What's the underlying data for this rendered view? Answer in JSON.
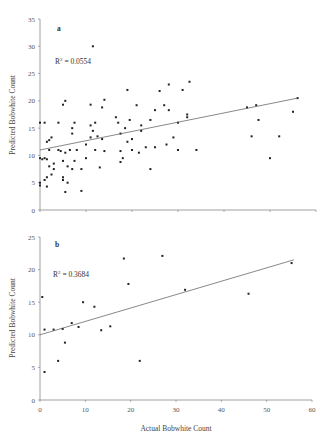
{
  "chart_data": [
    {
      "type": "scatter",
      "panel": "a",
      "title": "",
      "xlabel": "",
      "ylabel": "Predicted Bobwhite Count",
      "xlim": [
        0,
        60
      ],
      "ylim": [
        0,
        35
      ],
      "yticks": [
        0,
        5,
        10,
        15,
        20,
        25,
        30,
        35
      ],
      "xticks": [
        0,
        10,
        20,
        30,
        40,
        50,
        60
      ],
      "x_tick_labels_shown": false,
      "grid": false,
      "annotation": "R² = 0.0554",
      "trendline": {
        "x": [
          0,
          56
        ],
        "y": [
          11.0,
          20.5
        ]
      },
      "points": [
        [
          0,
          16
        ],
        [
          0,
          9.5
        ],
        [
          0,
          5
        ],
        [
          0,
          4.5
        ],
        [
          0.5,
          9.3
        ],
        [
          1,
          16
        ],
        [
          1,
          5.5
        ],
        [
          1,
          9.5
        ],
        [
          1.5,
          9.3
        ],
        [
          1.5,
          4.3
        ],
        [
          1.5,
          6
        ],
        [
          1.5,
          12.5
        ],
        [
          2,
          12.8
        ],
        [
          2,
          11
        ],
        [
          2,
          8
        ],
        [
          2.5,
          6.5
        ],
        [
          2.5,
          13.3
        ],
        [
          3,
          8.5
        ],
        [
          3,
          7.5
        ],
        [
          4,
          16
        ],
        [
          4,
          11
        ],
        [
          4.5,
          10.8
        ],
        [
          5,
          19.3
        ],
        [
          5,
          5.5
        ],
        [
          5,
          6
        ],
        [
          5,
          9
        ],
        [
          5.5,
          20
        ],
        [
          5.5,
          10.5
        ],
        [
          5.5,
          3.3
        ],
        [
          6,
          5
        ],
        [
          6,
          8
        ],
        [
          6.5,
          11
        ],
        [
          7,
          14
        ],
        [
          7,
          15
        ],
        [
          7,
          7.5
        ],
        [
          7.5,
          16
        ],
        [
          7.5,
          9
        ],
        [
          8,
          11
        ],
        [
          9,
          7.5
        ],
        [
          9,
          3.5
        ],
        [
          10,
          9.5
        ],
        [
          10,
          12
        ],
        [
          11,
          15.5
        ],
        [
          11,
          19.3
        ],
        [
          11,
          13.3
        ],
        [
          11.5,
          30
        ],
        [
          11.5,
          14.5
        ],
        [
          12,
          16
        ],
        [
          12,
          11
        ],
        [
          12.5,
          13.5
        ],
        [
          13,
          7.8
        ],
        [
          13.5,
          18.8
        ],
        [
          13.5,
          13
        ],
        [
          14,
          10.8
        ],
        [
          14,
          20.2
        ],
        [
          16.5,
          17
        ],
        [
          17,
          16
        ],
        [
          17.5,
          14
        ],
        [
          17.5,
          10.8
        ],
        [
          17.5,
          8.8
        ],
        [
          18,
          9.5
        ],
        [
          18.5,
          15
        ],
        [
          19,
          22
        ],
        [
          19,
          12.5
        ],
        [
          19.5,
          16.5
        ],
        [
          20,
          11
        ],
        [
          20,
          13
        ],
        [
          21,
          19.2
        ],
        [
          21.5,
          10.5
        ],
        [
          22,
          15.5
        ],
        [
          22,
          14.5
        ],
        [
          23,
          11.5
        ],
        [
          24,
          16.5
        ],
        [
          24,
          7.5
        ],
        [
          25,
          18.3
        ],
        [
          25,
          11.5
        ],
        [
          26,
          21.8
        ],
        [
          27,
          19.2
        ],
        [
          27.5,
          12
        ],
        [
          28,
          23
        ],
        [
          28,
          18.3
        ],
        [
          29,
          13.3
        ],
        [
          30,
          11
        ],
        [
          30,
          16
        ],
        [
          31,
          22
        ],
        [
          32,
          17.5
        ],
        [
          32,
          17
        ],
        [
          32.5,
          23.5
        ],
        [
          34,
          11
        ],
        [
          45,
          18.8
        ],
        [
          46,
          13.5
        ],
        [
          47,
          19.2
        ],
        [
          47.5,
          16.5
        ],
        [
          50,
          9.5
        ],
        [
          52,
          13.5
        ],
        [
          55,
          18
        ],
        [
          56,
          20.5
        ]
      ]
    },
    {
      "type": "scatter",
      "panel": "b",
      "title": "",
      "xlabel": "Actual Bobwhite Count",
      "ylabel": "Predicted Bobwhite Count",
      "xlim": [
        0,
        60
      ],
      "ylim": [
        0,
        25
      ],
      "yticks": [
        0,
        5,
        10,
        15,
        20,
        25
      ],
      "xticks": [
        0,
        10,
        20,
        30,
        40,
        50,
        60
      ],
      "grid": false,
      "annotation": "R² = 0.3684",
      "trendline": {
        "x": [
          0,
          56
        ],
        "y": [
          10.0,
          21.5
        ]
      },
      "points": [
        [
          0.5,
          15.8
        ],
        [
          1,
          10.8
        ],
        [
          1,
          4.3
        ],
        [
          3,
          10.8
        ],
        [
          4,
          6
        ],
        [
          5,
          10.9
        ],
        [
          5.5,
          8.8
        ],
        [
          7,
          11.8
        ],
        [
          8.5,
          11.2
        ],
        [
          9.5,
          15
        ],
        [
          12,
          14.3
        ],
        [
          13.5,
          10.7
        ],
        [
          15.5,
          11.3
        ],
        [
          18.5,
          21.7
        ],
        [
          19.5,
          17.8
        ],
        [
          22,
          6
        ],
        [
          27,
          22.1
        ],
        [
          32,
          16.9
        ],
        [
          46,
          16.3
        ],
        [
          55.5,
          21
        ]
      ]
    }
  ],
  "panels": {
    "a": {
      "label": "a",
      "r2": "R",
      "r2_sup": "2",
      "r2_value": " = 0.0554",
      "ylabel": "Predicted Bobwhite Count",
      "yticks": [
        "0",
        "5",
        "10",
        "15",
        "20",
        "25",
        "30",
        "35"
      ]
    },
    "b": {
      "label": "b",
      "r2": "R",
      "r2_sup": "2",
      "r2_value": " = 0.3684",
      "ylabel": "Predicted Bobwhite Count",
      "yticks": [
        "0",
        "5",
        "10",
        "15",
        "20",
        "25"
      ],
      "xticks": [
        "0",
        "10",
        "20",
        "30",
        "40",
        "50",
        "60"
      ],
      "xlabel": "Actual Bobwhite Count"
    }
  },
  "colors": {
    "axis": "#888888",
    "point": "#222222",
    "trendline": "#555555",
    "text": "#444444"
  }
}
